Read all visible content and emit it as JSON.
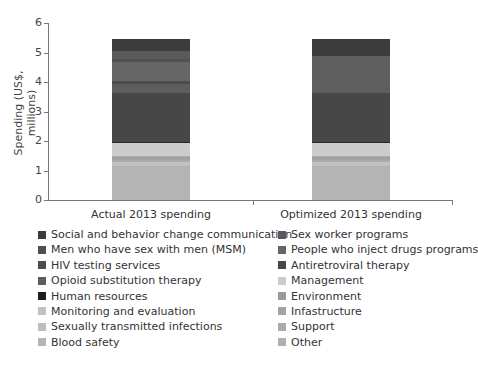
{
  "chart_data": {
    "type": "bar",
    "stacked": true,
    "title": "",
    "xlabel": "",
    "ylabel": "Spending (US$, millions)",
    "ylim": [
      0,
      6
    ],
    "yticks": [
      "0",
      "1",
      "2",
      "3",
      "4",
      "5",
      "6"
    ],
    "categories": [
      "Actual 2013 spending",
      "Optimized 2013 spending"
    ],
    "grid": false,
    "legend_position": "bottom",
    "series": [
      {
        "name": "Blood safety",
        "color": "#b4b4b4",
        "values": [
          1.15,
          1.15
        ]
      },
      {
        "name": "Sexually transmitted infections",
        "color": "#bdbdbd",
        "values": [
          0.05,
          0.05
        ]
      },
      {
        "name": "Monitoring and evaluation",
        "color": "#c2c2c2",
        "values": [
          0.08,
          0.08
        ]
      },
      {
        "name": "Support",
        "color": "#aaaaaa",
        "values": [
          0.08,
          0.08
        ]
      },
      {
        "name": "Infastructure",
        "color": "#a3a3a3",
        "values": [
          0.06,
          0.06
        ]
      },
      {
        "name": "Environment",
        "color": "#9a9a9a",
        "values": [
          0.05,
          0.05
        ]
      },
      {
        "name": "Other",
        "color": "#b0b0b0",
        "values": [
          0.03,
          0.03
        ]
      },
      {
        "name": "Management",
        "color": "#cccccc",
        "values": [
          0.45,
          0.45
        ]
      },
      {
        "name": "Human resources",
        "color": "#2a2a2a",
        "values": [
          0.02,
          0.02
        ]
      },
      {
        "name": "Antiretroviral therapy",
        "color": "#474747",
        "values": [
          1.65,
          1.65
        ]
      },
      {
        "name": "Opioid substitution therapy",
        "color": "#5e5e5e",
        "values": [
          0.3,
          1.25
        ]
      },
      {
        "name": "HIV testing services",
        "color": "#4d4d4d",
        "values": [
          0.1,
          0.0
        ]
      },
      {
        "name": "People who inject drugs programs",
        "color": "#666666",
        "values": [
          0.65,
          0.0
        ]
      },
      {
        "name": "Men who have sex with men (MSM)",
        "color": "#505050",
        "values": [
          0.12,
          0.0
        ]
      },
      {
        "name": "Sex worker programs",
        "color": "#5a5a5a",
        "values": [
          0.25,
          0.0
        ]
      },
      {
        "name": "Social and behavior change communication",
        "color": "#3c3c3c",
        "values": [
          0.42,
          0.6
        ]
      }
    ],
    "totals": [
      5.5,
      5.5
    ]
  },
  "legend": [
    {
      "label": "Social and behavior change communication",
      "color": "#3c3c3c"
    },
    {
      "label": "Sex worker programs",
      "color": "#5a5a5a"
    },
    {
      "label": "Men who have sex with men (MSM)",
      "color": "#505050"
    },
    {
      "label": "People who inject drugs programs",
      "color": "#666666"
    },
    {
      "label": "HIV testing services",
      "color": "#4d4d4d"
    },
    {
      "label": "Antiretroviral therapy",
      "color": "#474747"
    },
    {
      "label": "Opioid substitution therapy",
      "color": "#5e5e5e"
    },
    {
      "label": "Management",
      "color": "#cccccc"
    },
    {
      "label": "Human resources",
      "color": "#1e1e1e"
    },
    {
      "label": "Environment",
      "color": "#9a9a9a"
    },
    {
      "label": "Monitoring and evaluation",
      "color": "#c2c2c2"
    },
    {
      "label": "Infastructure",
      "color": "#a3a3a3"
    },
    {
      "label": "Sexually transmitted infections",
      "color": "#bdbdbd"
    },
    {
      "label": "Support",
      "color": "#aaaaaa"
    },
    {
      "label": "Blood safety",
      "color": "#b4b4b4"
    },
    {
      "label": "Other",
      "color": "#b0b0b0"
    }
  ]
}
